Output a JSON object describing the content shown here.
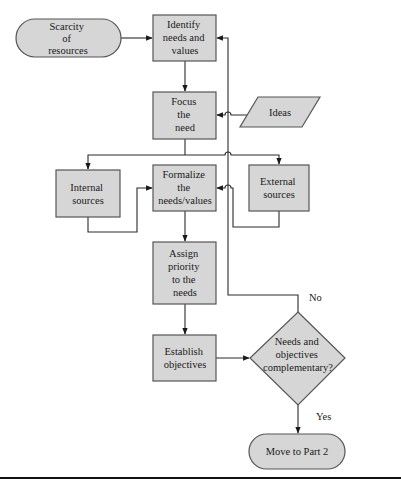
{
  "diagram": {
    "type": "flowchart",
    "colors": {
      "node_fill": "#d6d6d6",
      "node_stroke": "#555555",
      "edge": "#2a2a2a",
      "background": "#ffffff"
    },
    "nodes": {
      "scarcity": {
        "shape": "terminator",
        "lines": [
          "Scarcity",
          "of",
          "resources"
        ]
      },
      "identify": {
        "shape": "process",
        "lines": [
          "Identify",
          "needs and",
          "values"
        ]
      },
      "focus": {
        "shape": "process",
        "lines": [
          "Focus",
          "the",
          "need"
        ]
      },
      "ideas": {
        "shape": "data",
        "lines": [
          "Ideas"
        ]
      },
      "internal": {
        "shape": "process",
        "lines": [
          "Internal",
          "sources"
        ]
      },
      "formalize": {
        "shape": "process",
        "lines": [
          "Formalize",
          "the",
          "needs/values"
        ]
      },
      "external": {
        "shape": "process",
        "lines": [
          "External",
          "sources"
        ]
      },
      "assign": {
        "shape": "process",
        "lines": [
          "Assign",
          "priority",
          "to the",
          "needs"
        ]
      },
      "establish": {
        "shape": "process",
        "lines": [
          "Establish",
          "objectives"
        ]
      },
      "decision": {
        "shape": "decision",
        "lines": [
          "Needs and",
          "objectives",
          "complementary?"
        ]
      },
      "move": {
        "shape": "terminator",
        "lines": [
          "Move to Part 2"
        ]
      }
    },
    "edge_labels": {
      "no": "No",
      "yes": "Yes"
    },
    "edges": [
      {
        "from": "scarcity",
        "to": "identify"
      },
      {
        "from": "identify",
        "to": "focus"
      },
      {
        "from": "ideas",
        "to": "focus"
      },
      {
        "from": "focus",
        "to": "internal"
      },
      {
        "from": "focus",
        "to": "external"
      },
      {
        "from": "internal",
        "to": "formalize"
      },
      {
        "from": "external",
        "to": "formalize"
      },
      {
        "from": "formalize",
        "to": "assign"
      },
      {
        "from": "assign",
        "to": "establish"
      },
      {
        "from": "establish",
        "to": "decision"
      },
      {
        "from": "decision",
        "to": "identify",
        "label": "No"
      },
      {
        "from": "decision",
        "to": "move",
        "label": "Yes"
      }
    ]
  }
}
